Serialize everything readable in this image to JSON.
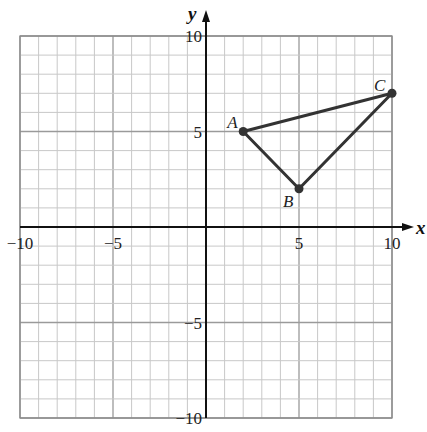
{
  "chart_data": {
    "type": "scatter",
    "title": "",
    "xlabel": "x",
    "ylabel": "y",
    "xlim": [
      -10,
      10
    ],
    "ylim": [
      -10,
      10
    ],
    "grid": true,
    "grid_step": 1,
    "x_ticks": [
      -10,
      -5,
      5,
      10
    ],
    "y_ticks": [
      -10,
      -5,
      5,
      10
    ],
    "x_tick_labels": [
      "−10",
      "−5",
      "5",
      "10"
    ],
    "y_tick_labels": [
      "−10",
      "−5",
      "5",
      "10"
    ],
    "points": [
      {
        "label": "A",
        "x": 2,
        "y": 5
      },
      {
        "label": "B",
        "x": 5,
        "y": 2
      },
      {
        "label": "C",
        "x": 10,
        "y": 7
      }
    ],
    "polygon": [
      "A",
      "B",
      "C"
    ],
    "shape": "triangle ABC"
  },
  "colors": {
    "grid": "#c8c8c8",
    "axis": "#111111",
    "triangle": "#333333",
    "background": "#ffffff"
  }
}
